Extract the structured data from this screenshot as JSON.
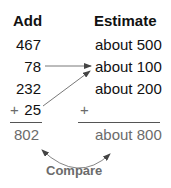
{
  "headers": {
    "add": "Add",
    "estimate": "Estimate"
  },
  "add_column": {
    "values": [
      "467",
      "78",
      "232",
      "25"
    ],
    "plus_sign": "+",
    "sum": "802"
  },
  "estimate_column": {
    "values": [
      "about 500",
      "about 100",
      "about 200"
    ],
    "plus_sign": "+",
    "sum": "about 800"
  },
  "compare_label": "Compare",
  "colors": {
    "text": "#111111",
    "result_text": "#6b6b6b",
    "arrow": "#444444"
  }
}
